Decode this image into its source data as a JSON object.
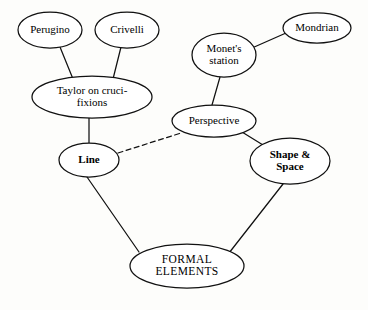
{
  "diagram": {
    "canvas": {
      "width": 368,
      "height": 310
    },
    "colors": {
      "background": "#fdfdfb",
      "node_fill": "#ffffff",
      "stroke": "#111111",
      "text": "#000000"
    },
    "nodes": [
      {
        "id": "perugino",
        "label": "Perugino",
        "lines": [
          "Perugino"
        ],
        "cx": 50,
        "cy": 30,
        "rx": 32,
        "ry": 18,
        "bold": false,
        "style": "sz-normal"
      },
      {
        "id": "crivelli",
        "label": "Crivelli",
        "lines": [
          "Crivelli"
        ],
        "cx": 127,
        "cy": 30,
        "rx": 32,
        "ry": 18,
        "bold": false,
        "style": "sz-normal"
      },
      {
        "id": "taylor-on-crucifixions",
        "label": "Taylor on cruci-fixions",
        "lines": [
          "Taylor on cruci-",
          "fixions"
        ],
        "cx": 92,
        "cy": 97,
        "rx": 60,
        "ry": 21,
        "bold": false,
        "style": "sz-normal"
      },
      {
        "id": "line",
        "label": "Line",
        "lines": [
          "Line"
        ],
        "cx": 89,
        "cy": 160,
        "rx": 30,
        "ry": 17,
        "bold": true,
        "style": "sz-normal"
      },
      {
        "id": "monets-station",
        "label": "Monet's station",
        "lines": [
          "Monet's",
          "station"
        ],
        "cx": 224,
        "cy": 55,
        "rx": 32,
        "ry": 22,
        "bold": false,
        "style": "sz-normal"
      },
      {
        "id": "mondrian",
        "label": "Mondrian",
        "lines": [
          "Mondrian"
        ],
        "cx": 317,
        "cy": 28,
        "rx": 34,
        "ry": 15,
        "bold": false,
        "style": "sz-normal"
      },
      {
        "id": "perspective",
        "label": "Perspective",
        "lines": [
          "Perspective"
        ],
        "cx": 214,
        "cy": 121,
        "rx": 42,
        "ry": 16,
        "bold": false,
        "style": "sz-normal"
      },
      {
        "id": "shape-and-space",
        "label": "Shape & Space",
        "lines": [
          "Shape &",
          "Space"
        ],
        "cx": 290,
        "cy": 161,
        "rx": 40,
        "ry": 23,
        "bold": true,
        "style": "sz-normal"
      },
      {
        "id": "formal-elements",
        "label": "FORMAL ELEMENTS",
        "lines": [
          "FORMAL",
          "ELEMENTS"
        ],
        "cx": 187,
        "cy": 266,
        "rx": 57,
        "ry": 22,
        "bold": false,
        "style": "sz-caps"
      }
    ],
    "edges": [
      {
        "id": "perugino-taylor",
        "from": "perugino",
        "to": "taylor-on-crucifixions",
        "x1": 60,
        "y1": 47,
        "x2": 73,
        "y2": 79,
        "dashed": false
      },
      {
        "id": "crivelli-taylor",
        "from": "crivelli",
        "to": "taylor-on-crucifixions",
        "x1": 121,
        "y1": 47,
        "x2": 113,
        "y2": 79,
        "dashed": false
      },
      {
        "id": "taylor-line",
        "from": "taylor-on-crucifixions",
        "to": "line",
        "x1": 89,
        "y1": 118,
        "x2": 89,
        "y2": 143,
        "dashed": false
      },
      {
        "id": "line-perspective",
        "from": "line",
        "to": "perspective",
        "x1": 118,
        "y1": 153,
        "x2": 181,
        "y2": 133,
        "dashed": true
      },
      {
        "id": "monet-mondrian",
        "from": "monets-station",
        "to": "mondrian",
        "x1": 252,
        "y1": 48,
        "x2": 286,
        "y2": 33,
        "dashed": false
      },
      {
        "id": "monet-perspective",
        "from": "monets-station",
        "to": "perspective",
        "x1": 220,
        "y1": 77,
        "x2": 212,
        "y2": 105,
        "dashed": false
      },
      {
        "id": "perspective-shape",
        "from": "perspective",
        "to": "shape-and-space",
        "x1": 242,
        "y1": 132,
        "x2": 263,
        "y2": 145,
        "dashed": false
      },
      {
        "id": "line-formal",
        "from": "line",
        "to": "formal-elements",
        "x1": 87,
        "y1": 177,
        "x2": 139,
        "y2": 252,
        "dashed": false
      },
      {
        "id": "shape-formal",
        "from": "shape-and-space",
        "to": "formal-elements",
        "x1": 283,
        "y1": 184,
        "x2": 229,
        "y2": 253,
        "dashed": false
      }
    ]
  }
}
